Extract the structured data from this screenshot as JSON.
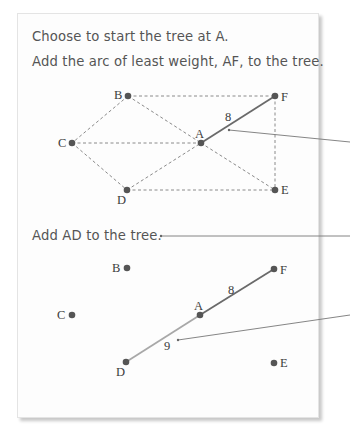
{
  "step1": {
    "line1": "Choose to start the tree at A.",
    "line2": "Add the arc of least weight, AF, to the tree."
  },
  "step2": {
    "line1": "Add AD to the tree."
  },
  "graph_top": {
    "nodes": {
      "A": "A",
      "B": "B",
      "C": "C",
      "D": "D",
      "E": "E",
      "F": "F"
    },
    "dashed_arcs": [
      "BF",
      "BC",
      "BA",
      "AE",
      "CA",
      "CD",
      "DA",
      "DE",
      "FE"
    ],
    "tree_arcs": [
      {
        "arc": "AF",
        "weight": "8"
      }
    ]
  },
  "graph_bottom": {
    "nodes": {
      "A": "A",
      "B": "B",
      "C": "C",
      "D": "D",
      "E": "E",
      "F": "F"
    },
    "tree_arcs": [
      {
        "arc": "AF",
        "weight": "8"
      },
      {
        "arc": "AD",
        "weight": "9"
      }
    ]
  },
  "colors": {
    "node": "#555555",
    "dashed": "#8a8a8a",
    "tree_arc_af": "#6a6a6a",
    "tree_arc_ad": "#a8a8a8",
    "pointer": "#777777",
    "text": "#555555"
  }
}
